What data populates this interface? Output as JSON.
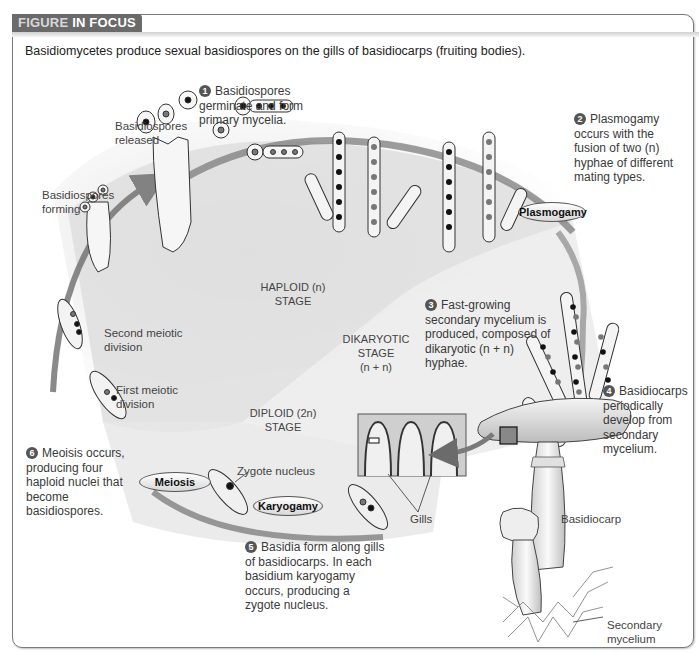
{
  "header": {
    "tab_part1": "FIGURE",
    "tab_part2": "IN FOCUS",
    "caption": "Basidiomycetes produce sexual basidiospores on the gills of basidiocarps (fruiting bodies)."
  },
  "steps": [
    {
      "number": "1",
      "text": "Basidiospores germinate and form primary mycelia."
    },
    {
      "number": "2",
      "text": "Plasmogamy occurs with the fusion of two (n) hyphae of different mating types."
    },
    {
      "number": "3",
      "text": "Fast-growing secondary mycelium is produced, composed of dikaryotic (n + n) hyphae."
    },
    {
      "number": "4",
      "text": "Basidiocarps periodically develop from secondary mycelium."
    },
    {
      "number": "5",
      "text": "Basidia form along gills of basidiocarps. In each basidium karyogamy occurs, producing a zygote nucleus."
    },
    {
      "number": "6",
      "text": "Meoisis occurs, producing four haploid nuclei that become basidiospores."
    }
  ],
  "stages": {
    "haploid": {
      "line1": "HAPLOID (n)",
      "line2": "STAGE"
    },
    "dikaryotic": {
      "line1": "DIKARYOTIC",
      "line2": "STAGE",
      "line3": "(n + n)"
    },
    "diploid": {
      "line1": "DIPLOID (2n)",
      "line2": "STAGE"
    }
  },
  "process_labels": {
    "plasmogamy": "Plasmogamy",
    "karyogamy": "Karyogamy",
    "meiosis": "Meiosis"
  },
  "annotations": {
    "basidiospores_released": [
      "Basidiospores",
      "released"
    ],
    "basidiospores_forming": [
      "Basidiospores",
      "forming"
    ],
    "second_meiotic_division": [
      "Second meiotic",
      "division"
    ],
    "first_meiotic_division": [
      "First meiotic",
      "division"
    ],
    "zygote_nucleus": "Zygote nucleus",
    "gills": "Gills",
    "basidiocarp": "Basidiocarp",
    "secondary_mycelium": [
      "Secondary",
      "mycelium"
    ]
  }
}
